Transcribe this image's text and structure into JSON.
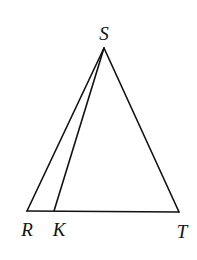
{
  "diagram": {
    "type": "geometry",
    "points": {
      "S": {
        "label": "S",
        "x": 104,
        "y": 48,
        "label_x": 104,
        "label_y": 40
      },
      "R": {
        "label": "R",
        "x": 27,
        "y": 211,
        "label_x": 27,
        "label_y": 236
      },
      "K": {
        "label": "K",
        "x": 54,
        "y": 211,
        "label_x": 59,
        "label_y": 236
      },
      "T": {
        "label": "T",
        "x": 179,
        "y": 212,
        "label_x": 182,
        "label_y": 238
      }
    },
    "segments": [
      {
        "name": "SR",
        "from": "S",
        "to": "R"
      },
      {
        "name": "SK",
        "from": "S",
        "to": "K"
      },
      {
        "name": "ST",
        "from": "S",
        "to": "T"
      },
      {
        "name": "RT",
        "from": "R",
        "to": "T"
      }
    ],
    "colors": {
      "stroke": "#111111",
      "background": "#ffffff"
    }
  }
}
